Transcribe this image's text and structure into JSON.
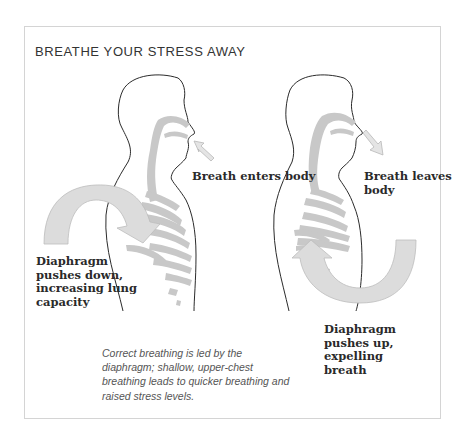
{
  "title": "BREATHE YOUR STRESS AWAY",
  "figures": [
    {
      "id": "inhale",
      "breath_label": "Breath enters body",
      "diaphragm_label": [
        "Diaphragm",
        "pushes down,",
        "increasing lung",
        "capacity"
      ]
    },
    {
      "id": "exhale",
      "breath_label": [
        "Breath leaves",
        "body"
      ],
      "diaphragm_label": [
        "Diaphragm",
        "pushes up,",
        "expelling",
        "breath"
      ]
    }
  ],
  "caption": "Correct breathing is led by the diaphragm; shallow, upper-chest breathing leads to quicker breathing and raised stress levels.",
  "colors": {
    "outline": "#2b2b2b",
    "airway": "#c8c8c8",
    "arrow_fill": "#dcdcdc",
    "arrow_stroke": "#bdbdbd",
    "border": "#d4d4d4"
  }
}
